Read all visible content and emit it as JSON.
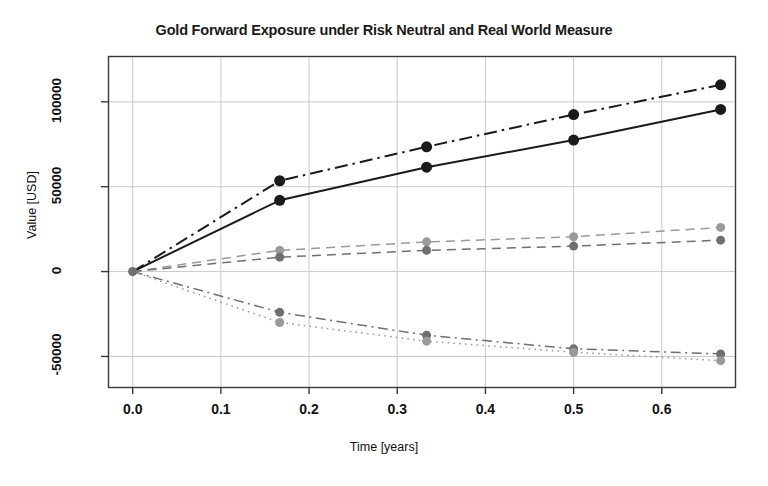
{
  "chart_data": {
    "type": "line",
    "title": "Gold Forward Exposure under Risk Neutral and Real World Measure",
    "xlabel": "Time [years]",
    "ylabel": "Value [USD]",
    "xlim": [
      -0.028,
      0.683
    ],
    "ylim": [
      -68000,
      127000
    ],
    "grid": true,
    "legend": "none",
    "xticks": [
      0.0,
      0.1,
      0.2,
      0.3,
      0.4,
      0.5,
      0.6
    ],
    "xtick_labels": [
      "0.0",
      "0.1",
      "0.2",
      "0.3",
      "0.4",
      "0.5",
      "0.6"
    ],
    "yticks": [
      -50000,
      0,
      50000,
      100000
    ],
    "ytick_labels": [
      "-50000",
      "0",
      "50000",
      "100000"
    ],
    "x": [
      0.0,
      0.1667,
      0.3333,
      0.5,
      0.6667
    ],
    "series": [
      {
        "name": "upper-dashdot-black",
        "values": [
          0,
          53500,
          73500,
          92500,
          110000
        ],
        "color": "#1a1a1a",
        "style": "dashdot",
        "marker": "filled-circle",
        "marker_size": 5.5
      },
      {
        "name": "upper-solid-black",
        "values": [
          0,
          42000,
          61500,
          77500,
          95500
        ],
        "color": "#1a1a1a",
        "style": "solid",
        "marker": "filled-circle",
        "marker_size": 5.5
      },
      {
        "name": "middle-dashed-lightgray",
        "values": [
          0,
          12500,
          17500,
          20500,
          26000
        ],
        "color": "#9a9a9a",
        "style": "dashed",
        "marker": "filled-circle",
        "marker_size": 4.5
      },
      {
        "name": "middle-dashed-darkgray",
        "values": [
          0,
          8500,
          12500,
          15000,
          18500
        ],
        "color": "#6f6f6f",
        "style": "dashed",
        "marker": "filled-circle",
        "marker_size": 4.5
      },
      {
        "name": "lower-dashdot-darkgray",
        "values": [
          0,
          -24000,
          -37500,
          -45500,
          -48500
        ],
        "color": "#6f6f6f",
        "style": "dashdot",
        "marker": "filled-circle",
        "marker_size": 4.5
      },
      {
        "name": "lower-dotted-lightgray",
        "values": [
          0,
          -30000,
          -41000,
          -47500,
          -52500
        ],
        "color": "#9a9a9a",
        "style": "dotted",
        "marker": "filled-circle",
        "marker_size": 4.5
      }
    ],
    "origin_marker": {
      "x": 0.0,
      "y": 0,
      "color": "#6f6f6f"
    }
  },
  "colors": {
    "background": "#ffffff",
    "axis": "#3a3a3a",
    "grid": "#c9c9c9",
    "text": "#111111"
  }
}
